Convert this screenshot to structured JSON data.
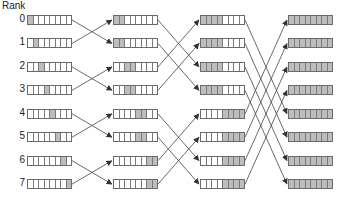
{
  "title": "Rank",
  "ranks": [
    "0",
    "1",
    "2",
    "3",
    "4",
    "5",
    "6",
    "7"
  ],
  "cells_per_buffer": 8,
  "colors": {
    "filled": "#bdbdbd",
    "empty": "#ffffff",
    "border": "#6a6a6a",
    "arrow": "#444444"
  },
  "stages": [
    {
      "name": "stage-0",
      "x": 27,
      "filled": [
        [
          0
        ],
        [
          1
        ],
        [
          2
        ],
        [
          3
        ],
        [
          4
        ],
        [
          5
        ],
        [
          6
        ],
        [
          7
        ]
      ]
    },
    {
      "name": "stage-1",
      "x": 113,
      "filled": [
        [
          0,
          1
        ],
        [
          0,
          1
        ],
        [
          2,
          3
        ],
        [
          2,
          3
        ],
        [
          4,
          5
        ],
        [
          4,
          5
        ],
        [
          6,
          7
        ],
        [
          6,
          7
        ]
      ]
    },
    {
      "name": "stage-2",
      "x": 200,
      "filled": [
        [
          0,
          1,
          2,
          3
        ],
        [
          0,
          1,
          2,
          3
        ],
        [
          0,
          1,
          2,
          3
        ],
        [
          0,
          1,
          2,
          3
        ],
        [
          4,
          5,
          6,
          7
        ],
        [
          4,
          5,
          6,
          7
        ],
        [
          4,
          5,
          6,
          7
        ],
        [
          4,
          5,
          6,
          7
        ]
      ]
    },
    {
      "name": "stage-3",
      "x": 288,
      "filled": [
        [
          0,
          1,
          2,
          3,
          4,
          5,
          6,
          7
        ],
        [
          0,
          1,
          2,
          3,
          4,
          5,
          6,
          7
        ],
        [
          0,
          1,
          2,
          3,
          4,
          5,
          6,
          7
        ],
        [
          0,
          1,
          2,
          3,
          4,
          5,
          6,
          7
        ],
        [
          0,
          1,
          2,
          3,
          4,
          5,
          6,
          7
        ],
        [
          0,
          1,
          2,
          3,
          4,
          5,
          6,
          7
        ],
        [
          0,
          1,
          2,
          3,
          4,
          5,
          6,
          7
        ],
        [
          0,
          1,
          2,
          3,
          4,
          5,
          6,
          7
        ]
      ]
    }
  ],
  "exchanges": [
    {
      "from": 0,
      "to": 1,
      "xor": 1
    },
    {
      "from": 1,
      "to": 2,
      "xor": 2
    },
    {
      "from": 2,
      "to": 3,
      "xor": 4
    }
  ],
  "layout": {
    "row_top": 15,
    "row_pitch": 23.45,
    "buf_width": 45,
    "buf_height": 10
  }
}
